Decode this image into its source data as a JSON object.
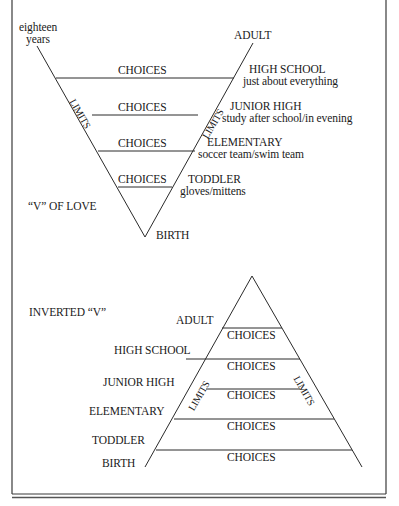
{
  "v_of_love": {
    "title": "“V” OF LOVE",
    "top_left_label": [
      "eighteen",
      "years"
    ],
    "top_right_label": "ADULT",
    "bottom_label": "BIRTH",
    "side_label": "LIMITS",
    "bands": [
      {
        "choices": "CHOICES",
        "stage": "HIGH SCHOOL",
        "example": "just about everything"
      },
      {
        "choices": "CHOICES",
        "stage": "JUNIOR HIGH",
        "example": "study after school/in evening"
      },
      {
        "choices": "CHOICES",
        "stage": "ELEMENTARY",
        "example": "soccer team/swim team"
      },
      {
        "choices": "CHOICES",
        "stage": "TODDLER",
        "example": "gloves/mittens"
      }
    ]
  },
  "inverted_v": {
    "title": "INVERTED “V”",
    "side_label": "LIMITS",
    "stages": [
      "ADULT",
      "HIGH SCHOOL",
      "JUNIOR HIGH",
      "ELEMENTARY",
      "TODDLER",
      "BIRTH"
    ],
    "bands": [
      "CHOICES",
      "CHOICES",
      "CHOICES",
      "CHOICES",
      "CHOICES"
    ]
  },
  "colors": {
    "line": "#2a2a2a",
    "frame": "#3a3a3a",
    "background": "#ffffff"
  }
}
